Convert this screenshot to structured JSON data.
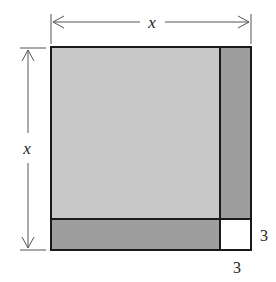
{
  "diagram": {
    "labels": {
      "top_dimension": "x",
      "left_dimension": "x",
      "right_small": "3",
      "bottom_small": "3"
    },
    "colors": {
      "large_square": "#c8c8c8",
      "rectangles": "#9e9e9e",
      "small_square": "#ffffff",
      "outline": "#1a1a1a",
      "dimension_lines": "#555555"
    },
    "regions": [
      {
        "name": "large-square",
        "label": "x by x"
      },
      {
        "name": "right-strip",
        "label": "x by 3"
      },
      {
        "name": "bottom-strip",
        "label": "x by 3"
      },
      {
        "name": "small-square",
        "label": "3 by 3"
      }
    ]
  }
}
